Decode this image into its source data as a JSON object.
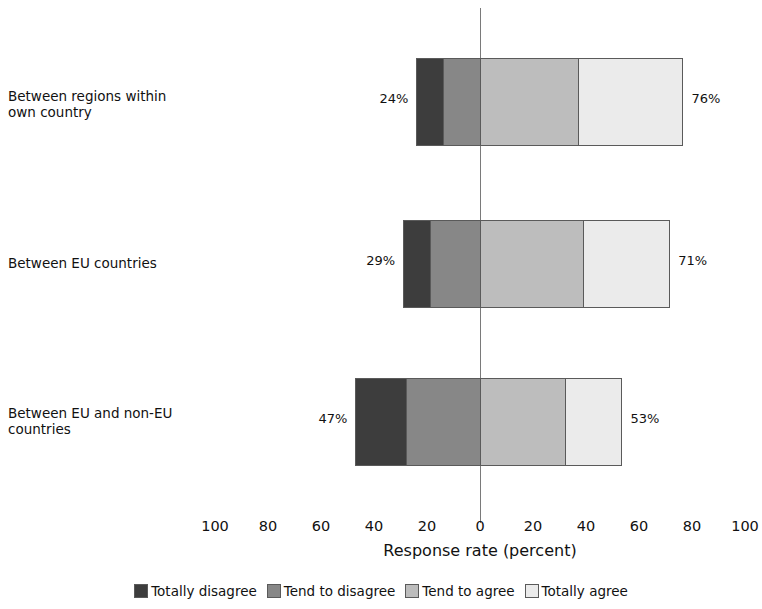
{
  "chart_data": {
    "type": "bar",
    "orientation": "horizontal",
    "stacked": true,
    "diverging": true,
    "title": "",
    "xlabel": "Response rate (percent)",
    "ylabel": "",
    "xlim": [
      -100,
      100
    ],
    "xticks": [
      "100",
      "80",
      "60",
      "40",
      "20",
      "0",
      "20",
      "40",
      "60",
      "80",
      "100"
    ],
    "xtick_values": [
      -100,
      -80,
      -60,
      -40,
      -20,
      0,
      20,
      40,
      60,
      80,
      100
    ],
    "grid": false,
    "legend_position": "bottom",
    "categories": [
      "Between regions within own country",
      "Between EU countries",
      "Between EU and non-EU countries"
    ],
    "series": [
      {
        "name": "Totally disagree",
        "color": "#3d3d3d",
        "values": [
          10,
          10,
          19
        ]
      },
      {
        "name": "Tend to disagree",
        "color": "#878787",
        "values": [
          14,
          19,
          28
        ]
      },
      {
        "name": "Tend to agree",
        "color": "#bdbdbd",
        "values": [
          37,
          39,
          32
        ]
      },
      {
        "name": "Totally agree",
        "color": "#ebebeb",
        "values": [
          39,
          32,
          21
        ]
      }
    ],
    "totals": {
      "disagree": [
        "24%",
        "29%",
        "47%"
      ],
      "agree": [
        "76%",
        "71%",
        "53%"
      ]
    }
  },
  "categories": [
    {
      "line1": "Between regions within",
      "line2": "own country"
    },
    {
      "line1": "Between EU countries",
      "line2": ""
    },
    {
      "line1": "Between EU and non-EU",
      "line2": "countries"
    }
  ],
  "axis": {
    "title": "Response rate (percent)",
    "ticks": [
      "100",
      "80",
      "60",
      "40",
      "20",
      "0",
      "20",
      "40",
      "60",
      "80",
      "100"
    ]
  },
  "legend": [
    {
      "label": "Totally disagree"
    },
    {
      "label": "Tend to disagree"
    },
    {
      "label": "Tend to agree"
    },
    {
      "label": "Totally agree"
    }
  ],
  "bars": [
    {
      "left_total_label": "24%",
      "right_total_label": "76%",
      "segments": [
        {
          "name": "Totally disagree",
          "value": 10
        },
        {
          "name": "Tend to disagree",
          "value": 14
        },
        {
          "name": "Tend to agree",
          "value": 37
        },
        {
          "name": "Totally agree",
          "value": 39
        }
      ]
    },
    {
      "left_total_label": "29%",
      "right_total_label": "71%",
      "segments": [
        {
          "name": "Totally disagree",
          "value": 10
        },
        {
          "name": "Tend to disagree",
          "value": 19
        },
        {
          "name": "Tend to agree",
          "value": 39
        },
        {
          "name": "Totally agree",
          "value": 32
        }
      ]
    },
    {
      "left_total_label": "47%",
      "right_total_label": "53%",
      "segments": [
        {
          "name": "Totally disagree",
          "value": 19
        },
        {
          "name": "Tend to disagree",
          "value": 28
        },
        {
          "name": "Tend to agree",
          "value": 32
        },
        {
          "name": "Totally agree",
          "value": 21
        }
      ]
    }
  ]
}
